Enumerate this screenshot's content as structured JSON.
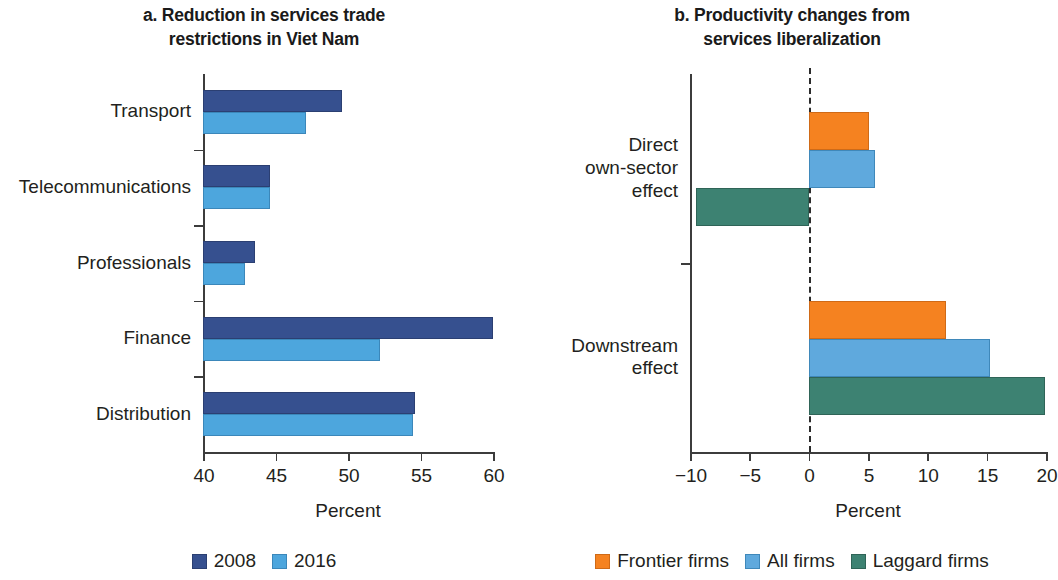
{
  "figure": {
    "panel_a": {
      "title_line1": "a. Reduction in services trade",
      "title_line2": "restrictions in Viet Nam",
      "xlabel": "Percent",
      "legend": [
        {
          "label": "2008",
          "color": "#36508f"
        },
        {
          "label": "2016",
          "color": "#4da6dd"
        }
      ],
      "ticks": [
        "40",
        "45",
        "50",
        "55",
        "60"
      ],
      "categories": [
        "Transport",
        "Telecommunications",
        "Professionals",
        "Finance",
        "Distribution"
      ]
    },
    "panel_b": {
      "title_line1": "b. Productivity changes from",
      "title_line2": "services liberalization",
      "xlabel": "Percent",
      "legend": [
        {
          "label": "Frontier firms",
          "color": "#f58220"
        },
        {
          "label": "All firms",
          "color": "#5fa9dd"
        },
        {
          "label": "Laggard firms",
          "color": "#3d8272"
        }
      ],
      "ticks": [
        "−10",
        "−5",
        "0",
        "5",
        "10",
        "15",
        "20"
      ],
      "categories": [
        "Direct own-sector effect",
        "Downstream effect"
      ],
      "category_lines": [
        [
          "Direct",
          "own-sector",
          "effect"
        ],
        [
          "Downstream",
          "effect"
        ]
      ]
    }
  },
  "chart_data": [
    {
      "type": "bar",
      "orientation": "horizontal",
      "title": "a. Reduction in services trade restrictions in Viet Nam",
      "xlabel": "Percent",
      "ylabel": "",
      "xlim": [
        40,
        60
      ],
      "xticks": [
        40,
        45,
        50,
        55,
        60
      ],
      "grid": false,
      "legend_position": "bottom",
      "categories": [
        "Transport",
        "Telecommunications",
        "Professionals",
        "Finance",
        "Distribution"
      ],
      "series": [
        {
          "name": "2008",
          "color": "#36508f",
          "values": [
            49.6,
            44.6,
            43.6,
            60.0,
            54.6
          ]
        },
        {
          "name": "2016",
          "color": "#4da6dd",
          "values": [
            47.1,
            44.6,
            42.9,
            52.2,
            54.5
          ]
        }
      ]
    },
    {
      "type": "bar",
      "orientation": "horizontal",
      "title": "b. Productivity changes from services liberalization",
      "xlabel": "Percent",
      "ylabel": "",
      "xlim": [
        -10,
        20
      ],
      "xticks": [
        -10,
        -5,
        0,
        5,
        10,
        15,
        20
      ],
      "grid": false,
      "zero_line": 0,
      "legend_position": "bottom",
      "categories": [
        "Direct own-sector effect",
        "Downstream effect"
      ],
      "series": [
        {
          "name": "Frontier firms",
          "color": "#f58220",
          "values": [
            5.1,
            11.6
          ]
        },
        {
          "name": "All firms",
          "color": "#5fa9dd",
          "values": [
            5.6,
            15.3
          ]
        },
        {
          "name": "Laggard firms",
          "color": "#3d8272",
          "values": [
            -9.5,
            19.9
          ]
        }
      ]
    }
  ]
}
